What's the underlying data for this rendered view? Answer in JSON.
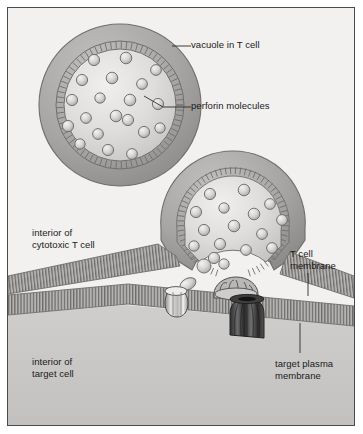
{
  "figure": {
    "type": "biological-diagram",
    "frame": {
      "border_color": "#4a4a4a",
      "background": "#f2f1ef"
    }
  },
  "labels": {
    "vacuole": "vacuole in T cell",
    "perforin": "perforin molecules",
    "t_cell_interior": "interior of\ncytotoxic T cell",
    "t_cell_interior_line1": "interior of",
    "t_cell_interior_line2": "cytotoxic T cell",
    "t_cell_membrane_line1": "T cell",
    "t_cell_membrane_line2": "membrane",
    "target_interior_line1": "interior of",
    "target_interior_line2": "target cell",
    "target_membrane_line1": "target plasma",
    "target_membrane_line2": "membrane"
  },
  "colors": {
    "text": "#1a1a1a",
    "leader": "#2b2b2b",
    "cytosol": "#f2f1ef",
    "target_cytosol": "#c9c8c6",
    "vacuole_rim": "#a8a7a5",
    "vacuole_rim_dark": "#8d8c8a",
    "vacuole_lumen": "#dedddb",
    "membrane_band": "#b4b3b1",
    "membrane_hatch": "#6e6d6b",
    "sphere_fill": "#d7d6d4",
    "sphere_edge": "#6b6a68",
    "pore_dark": "#3a3a3a",
    "pore_light": "#c4c3c1",
    "outline": "#4a4a4a"
  },
  "structures": {
    "vacuole_free": {
      "name": "vacuole in T cell (unfused)",
      "cx": 112,
      "cy": 97,
      "r": 82,
      "perforin_count": 20
    },
    "vacuole_fusing": {
      "name": "vacuole fusing with T cell membrane",
      "cx": 225,
      "cy": 215,
      "r": 72,
      "perforin_count": 16
    },
    "t_cell_membrane": {
      "name": "T cell plasma membrane",
      "orientation": "horizontal band"
    },
    "target_membrane": {
      "name": "target plasma membrane",
      "orientation": "horizontal band"
    },
    "cleft_items": [
      {
        "name": "released perforin monomer",
        "stage": "free in cleft"
      },
      {
        "name": "perforin monomer",
        "stage": "free in cleft"
      },
      {
        "name": "assembling perforin ring",
        "stage": "polymerising"
      },
      {
        "name": "partially inserted perforin ring",
        "stage": "inserting"
      },
      {
        "name": "completed transmembrane pore",
        "stage": "pore formed in target membrane"
      }
    ]
  },
  "leaders": [
    {
      "name": "vacuole-leader",
      "x1": 171,
      "y1": 45,
      "x2": 183,
      "y2": 45
    },
    {
      "name": "perforin-leader",
      "x1": 143,
      "y1": 94,
      "x2": 183,
      "y2": 103
    },
    {
      "name": "t-cell-membrane-leader",
      "x1": 307,
      "y1": 272,
      "x2": 307,
      "y2": 296
    },
    {
      "name": "target-membrane-leader",
      "x1": 300,
      "y1": 322,
      "x2": 300,
      "y2": 353
    }
  ]
}
